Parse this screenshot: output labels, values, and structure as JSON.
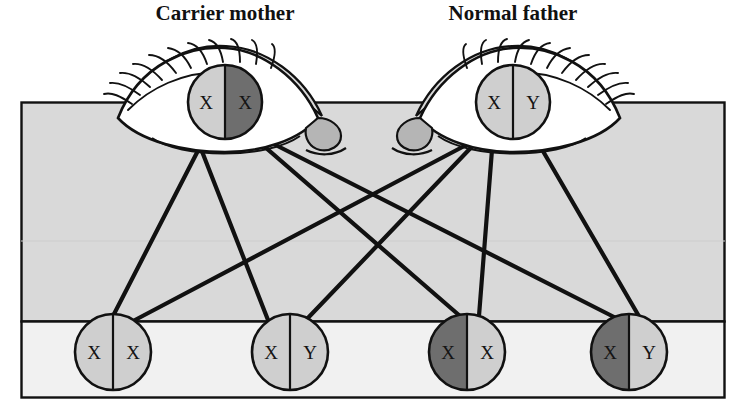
{
  "figure": {
    "type": "genetics-pedigree-diagram",
    "background_color": "#ffffff"
  },
  "colors": {
    "panel_upper": "#d9d9d9",
    "panel_lower": "#f0f0f0",
    "allele_light": "#cfcfcf",
    "allele_dark": "#6e6e6e",
    "outline": "#111111",
    "eye_white": "#ffffff",
    "tear_duct": "#b5b5b5",
    "eyelid_fill": "#d9d9d9"
  },
  "labels": {
    "mother": "Carrier mother",
    "father": "Normal father"
  },
  "parents": [
    {
      "id": "mother",
      "label": "Carrier mother",
      "label_x": 225,
      "label_y": 19,
      "cx": 225,
      "cy": 102,
      "r": 37,
      "eye_mirrored": false,
      "left_allele": {
        "text": "X",
        "shade": "light"
      },
      "right_allele": {
        "text": "X",
        "shade": "dark"
      }
    },
    {
      "id": "father",
      "label": "Normal father",
      "label_x": 513,
      "label_y": 19,
      "cx": 513,
      "cy": 102,
      "r": 37,
      "eye_mirrored": true,
      "left_allele": {
        "text": "X",
        "shade": "light"
      },
      "right_allele": {
        "text": "Y",
        "shade": "light"
      }
    }
  ],
  "children": [
    {
      "id": "child-1",
      "cx": 113,
      "cy": 352,
      "r": 38,
      "left_allele": {
        "text": "X",
        "shade": "light"
      },
      "right_allele": {
        "text": "X",
        "shade": "light"
      }
    },
    {
      "id": "child-2",
      "cx": 290,
      "cy": 352,
      "r": 38,
      "left_allele": {
        "text": "X",
        "shade": "light"
      },
      "right_allele": {
        "text": "Y",
        "shade": "light"
      }
    },
    {
      "id": "child-3",
      "cx": 467,
      "cy": 352,
      "r": 38,
      "left_allele": {
        "text": "X",
        "shade": "dark"
      },
      "right_allele": {
        "text": "X",
        "shade": "light"
      }
    },
    {
      "id": "child-4",
      "cx": 629,
      "cy": 352,
      "r": 38,
      "left_allele": {
        "text": "X",
        "shade": "dark"
      },
      "right_allele": {
        "text": "Y",
        "shade": "light"
      }
    }
  ],
  "panels": {
    "upper": {
      "x": 21,
      "y": 102,
      "width": 704,
      "height": 220
    },
    "lower": {
      "x": 21,
      "y": 322,
      "width": 704,
      "height": 76
    }
  },
  "connections": [
    {
      "from": "mother",
      "to": "child-1"
    },
    {
      "from": "mother",
      "to": "child-2"
    },
    {
      "from": "mother",
      "to": "child-3"
    },
    {
      "from": "mother",
      "to": "child-4"
    },
    {
      "from": "father",
      "to": "child-1"
    },
    {
      "from": "father",
      "to": "child-2"
    },
    {
      "from": "father",
      "to": "child-3"
    },
    {
      "from": "father",
      "to": "child-4"
    }
  ]
}
